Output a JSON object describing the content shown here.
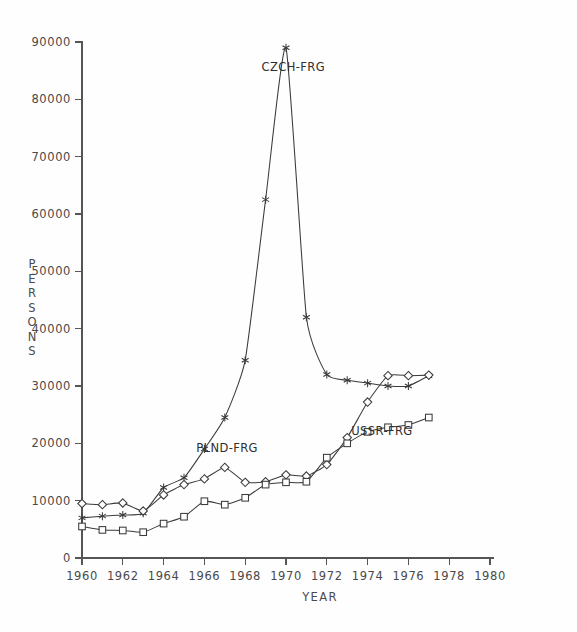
{
  "chart_data": {
    "type": "line",
    "title": "",
    "xlabel": "YEAR",
    "ylabel": "PERSONS",
    "xlim": [
      1960,
      1980
    ],
    "ylim": [
      0,
      90000
    ],
    "xticks": [
      1960,
      1962,
      1964,
      1966,
      1968,
      1970,
      1972,
      1974,
      1976,
      1978,
      1980
    ],
    "xtick_labels": [
      "1960",
      "1962",
      "1964",
      "1966",
      "1968",
      "1970",
      "1972",
      "1974",
      "1976",
      "1978",
      "1980"
    ],
    "yticks": [
      0,
      10000,
      20000,
      30000,
      40000,
      50000,
      60000,
      70000,
      80000,
      90000
    ],
    "ytick_labels": [
      "0",
      "10000",
      "20000",
      "30000",
      "40000",
      "50000",
      "60000",
      "70000",
      "80000",
      "90000"
    ],
    "grid": false,
    "legend_position": "inline-annotations",
    "x": [
      1960,
      1961,
      1962,
      1963,
      1964,
      1965,
      1966,
      1967,
      1968,
      1969,
      1970,
      1971,
      1972,
      1973,
      1974,
      1975,
      1976,
      1977
    ],
    "series": [
      {
        "name": "CZCH-FRG",
        "marker": "asterisk",
        "label": "CZCH-FRG",
        "label_x": 1968.8,
        "label_y": 85000,
        "values": [
          7000,
          7300,
          7500,
          7800,
          12300,
          14000,
          19000,
          24500,
          34500,
          62500,
          89000,
          42000,
          32000,
          31000,
          30500,
          30000,
          30000,
          31800
        ],
        "values_note": "CZCH-FRG emigration, peak 1970"
      },
      {
        "name": "PLND-FRG",
        "marker": "diamond",
        "label": "PLND-FRG",
        "label_x": 1965.6,
        "label_y": 18500,
        "values": [
          9500,
          9300,
          9600,
          8200,
          11000,
          12800,
          13800,
          15800,
          13200,
          13300,
          14500,
          14300,
          16300,
          21000,
          27200,
          31800,
          31800,
          31900
        ]
      },
      {
        "name": "USSR-FRG",
        "marker": "square",
        "label": "USSR-FRG",
        "label_x": 1973.2,
        "label_y": 21500,
        "values": [
          5500,
          4900,
          4800,
          4500,
          6000,
          7200,
          9900,
          9300,
          10500,
          12800,
          13200,
          13300,
          17500,
          20000,
          22000,
          22800,
          23200,
          24500
        ]
      }
    ]
  },
  "axis": {
    "y_label_text": "PERSONS",
    "x_label_text": "YEAR"
  }
}
